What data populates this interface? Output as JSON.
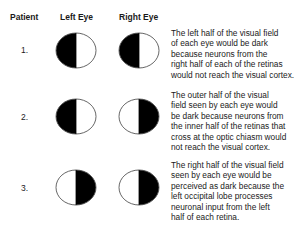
{
  "headers": {
    "patient": "Patient",
    "left_eye": "Left Eye",
    "right_eye": "Right Eye"
  },
  "rows": [
    {
      "number": "1.",
      "left_eye_dark_side": "left",
      "right_eye_dark_side": "left",
      "description": "The left half of the visual field\nof each eye would be dark\nbecause neurons from the\nright half of each of the retinas\nwould not reach the visual cortex."
    },
    {
      "number": "2.",
      "left_eye_dark_side": "left",
      "right_eye_dark_side": "right",
      "description": "The outer half of the visual\nfield seen by each eye would\nbe dark because neurons from\nthe inner half of the retinas that\ncross at the optic chiasm would\nnot reach the visual cortex."
    },
    {
      "number": "3.",
      "left_eye_dark_side": "right",
      "right_eye_dark_side": "right",
      "description": "The right half of the visual field\nseen by each eye would be\nperceived as dark because the\nleft occipital lobe processes\nneuronal input from the left\nhalf of each retina."
    }
  ],
  "colors": {
    "dark_fill": "#000000",
    "light_fill": "#ffffff",
    "outline": "#555555"
  }
}
